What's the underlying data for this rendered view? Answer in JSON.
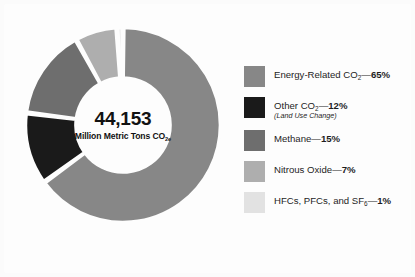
{
  "background_color": "#fdfdfd",
  "center": {
    "value": "44,153",
    "units_prefix": "Million Metric Tons CO",
    "units_subscript": "2e"
  },
  "legend": {
    "items": [
      {
        "name": "energy-related-co2",
        "label_prefix": "Energy-Related CO",
        "label_subscript": "2",
        "separator": "—",
        "percent_label": "65%",
        "note": "",
        "color": "#878787",
        "value": 65
      },
      {
        "name": "other-co2",
        "label_prefix": "Other CO",
        "label_subscript": "2",
        "separator": "—",
        "percent_label": "12%",
        "note": "(Land Use Change)",
        "color": "#1a1a1a",
        "value": 12
      },
      {
        "name": "methane",
        "label_prefix": "Methane",
        "label_subscript": "",
        "separator": "—",
        "percent_label": "15%",
        "note": "",
        "color": "#6e6e6e",
        "value": 15
      },
      {
        "name": "nitrous-oxide",
        "label_prefix": "Nitrous Oxide",
        "label_subscript": "",
        "separator": "—",
        "percent_label": "7%",
        "note": "",
        "color": "#aeaeae",
        "value": 7
      },
      {
        "name": "hfcs-pfcs-sf6",
        "label_prefix": "HFCs, PFCs, and SF",
        "label_subscript": "6",
        "separator": "—",
        "percent_label": "1%",
        "note": "",
        "color": "#e2e2e2",
        "value": 1
      }
    ]
  },
  "chart_data": {
    "type": "pie",
    "variant": "donut",
    "title": "",
    "subtitle": "",
    "center_text": "44,153 Million Metric Tons CO2e",
    "total": 44153,
    "total_units": "Million Metric Tons CO2e",
    "unit": "percent",
    "start_angle_deg": 0,
    "direction": "clockwise",
    "inner_radius_ratio": 0.49,
    "slice_gap_deg": 1.6,
    "legend_position": "right",
    "categories": [
      "Energy-Related CO2",
      "Other CO2 (Land Use Change)",
      "Methane",
      "Nitrous Oxide",
      "HFCs, PFCs, and SF6"
    ],
    "values": [
      65,
      12,
      15,
      7,
      1
    ],
    "colors": [
      "#878787",
      "#1a1a1a",
      "#6e6e6e",
      "#aeaeae",
      "#e2e2e2"
    ],
    "data_labels": [
      "65%",
      "12%",
      "15%",
      "7%",
      "1%"
    ]
  }
}
